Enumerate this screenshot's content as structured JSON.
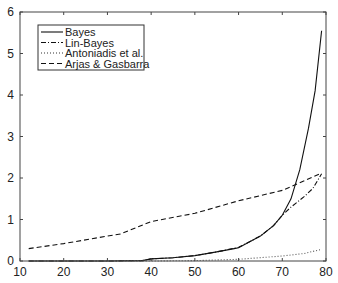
{
  "chart_data": {
    "type": "line",
    "title": "",
    "xlabel": "",
    "ylabel": "",
    "xlim": [
      10,
      80
    ],
    "ylim": [
      0,
      6
    ],
    "xticks": [
      10,
      20,
      30,
      40,
      50,
      60,
      70,
      80
    ],
    "yticks": [
      0,
      1,
      2,
      3,
      4,
      5,
      6
    ],
    "grid": false,
    "legend_position": "upper-left",
    "series": [
      {
        "name": "Bayes",
        "style": "solid",
        "x": [
          12,
          20,
          30,
          38,
          40,
          45,
          50,
          55,
          59,
          60,
          65,
          68,
          70,
          72,
          74,
          76,
          77.5,
          79
        ],
        "y": [
          0,
          0,
          0,
          0.01,
          0.05,
          0.08,
          0.13,
          0.22,
          0.3,
          0.32,
          0.6,
          0.85,
          1.1,
          1.5,
          2.2,
          3.2,
          4.1,
          5.55
        ]
      },
      {
        "name": "Lin-Bayes",
        "style": "dash-dot",
        "x": [
          12,
          20,
          30,
          38,
          40,
          45,
          50,
          55,
          60,
          65,
          68,
          70,
          72,
          75,
          77,
          79
        ],
        "y": [
          0,
          0,
          0,
          0.01,
          0.05,
          0.08,
          0.13,
          0.22,
          0.33,
          0.6,
          0.85,
          1.1,
          1.3,
          1.55,
          1.75,
          2.1
        ]
      },
      {
        "name": "Antoniadis et al.",
        "style": "dotted",
        "x": [
          12,
          20,
          30,
          40,
          50,
          60,
          70,
          75,
          79
        ],
        "y": [
          0,
          0,
          0,
          0,
          0.01,
          0.04,
          0.12,
          0.18,
          0.28
        ]
      },
      {
        "name": "Arjas & Gasbarra",
        "style": "dashed",
        "x": [
          12,
          20,
          30,
          33,
          40,
          50,
          60,
          70,
          79
        ],
        "y": [
          0.3,
          0.42,
          0.6,
          0.65,
          0.95,
          1.15,
          1.45,
          1.7,
          2.12
        ]
      }
    ]
  },
  "legend": {
    "items": [
      "Bayes",
      "Lin-Bayes",
      "Antoniadis et al.",
      "Arjas & Gasbarra"
    ]
  },
  "axis": {
    "xticks": [
      "10",
      "20",
      "30",
      "40",
      "50",
      "60",
      "70",
      "80"
    ],
    "yticks": [
      "0",
      "1",
      "2",
      "3",
      "4",
      "5",
      "6"
    ]
  }
}
